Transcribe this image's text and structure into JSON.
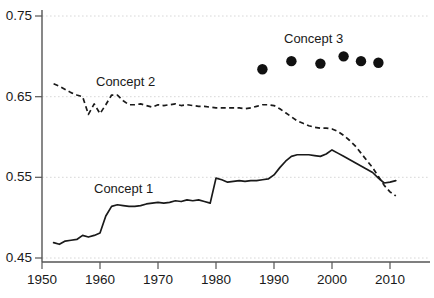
{
  "chart_data": {
    "type": "line",
    "title": "",
    "xlabel": "",
    "ylabel": "",
    "xlim": [
      1950,
      2012
    ],
    "ylim": [
      0.45,
      0.75
    ],
    "grid": true,
    "grid_axis": "y",
    "legend": "inline-annotations",
    "xticks": [
      1950,
      1960,
      1970,
      1980,
      1990,
      2000,
      2010
    ],
    "xtick_labels": [
      "1950",
      "1960",
      "1970",
      "1980",
      "1990",
      "2000",
      "2010"
    ],
    "yticks": [
      0.45,
      0.55,
      0.65,
      0.75
    ],
    "ytick_labels": [
      "0.45",
      "0.55",
      "0.65",
      "0.75"
    ],
    "annotations": [
      {
        "text": "Concept 1",
        "x": 1961.5,
        "y": 0.5325,
        "series": "Concept 1"
      },
      {
        "text": "Concept 2",
        "x": 1962.0,
        "y": 0.6725,
        "series": "Concept 2"
      },
      {
        "text": "Concept 3",
        "x": 1996.5,
        "y": 0.7175,
        "series": "Concept 3"
      }
    ],
    "series": [
      {
        "name": "Concept 1",
        "style": "solid",
        "color": "#1a1a1a",
        "x": [
          1952,
          1953,
          1954,
          1955,
          1956,
          1957,
          1958,
          1959,
          1960,
          1961,
          1962,
          1963,
          1964,
          1965,
          1966,
          1967,
          1968,
          1969,
          1970,
          1971,
          1972,
          1973,
          1974,
          1975,
          1976,
          1977,
          1978,
          1979,
          1980,
          1981,
          1982,
          1983,
          1984,
          1985,
          1986,
          1987,
          1988,
          1989,
          1990,
          1991,
          1992,
          1993,
          1994,
          1995,
          1996,
          1997,
          1998,
          1999,
          2000,
          2001,
          2002,
          2003,
          2004,
          2005,
          2006,
          2007,
          2008,
          2009,
          2010,
          2011
        ],
        "values": [
          0.469,
          0.467,
          0.471,
          0.472,
          0.473,
          0.478,
          0.476,
          0.478,
          0.481,
          0.502,
          0.514,
          0.516,
          0.515,
          0.514,
          0.514,
          0.515,
          0.517,
          0.518,
          0.519,
          0.518,
          0.519,
          0.521,
          0.52,
          0.522,
          0.521,
          0.522,
          0.52,
          0.518,
          0.549,
          0.547,
          0.544,
          0.545,
          0.546,
          0.545,
          0.546,
          0.546,
          0.547,
          0.548,
          0.553,
          0.562,
          0.57,
          0.576,
          0.578,
          0.578,
          0.578,
          0.577,
          0.576,
          0.579,
          0.584,
          0.58,
          0.576,
          0.572,
          0.568,
          0.564,
          0.56,
          0.556,
          0.549,
          0.543,
          0.544,
          0.546
        ]
      },
      {
        "name": "Concept 2",
        "style": "dashed",
        "color": "#1a1a1a",
        "x": [
          1952,
          1953,
          1954,
          1955,
          1956,
          1957,
          1958,
          1959,
          1960,
          1961,
          1962,
          1963,
          1964,
          1965,
          1966,
          1967,
          1968,
          1969,
          1970,
          1971,
          1972,
          1973,
          1974,
          1975,
          1976,
          1977,
          1978,
          1979,
          1980,
          1981,
          1982,
          1983,
          1984,
          1985,
          1986,
          1987,
          1988,
          1989,
          1990,
          1991,
          1992,
          1993,
          1994,
          1995,
          1996,
          1997,
          1998,
          1999,
          2000,
          2001,
          2002,
          2003,
          2004,
          2005,
          2006,
          2007,
          2008,
          2009,
          2010,
          2011
        ],
        "values": [
          0.666,
          0.663,
          0.659,
          0.655,
          0.652,
          0.65,
          0.628,
          0.641,
          0.629,
          0.64,
          0.652,
          0.652,
          0.645,
          0.64,
          0.64,
          0.641,
          0.639,
          0.637,
          0.64,
          0.639,
          0.64,
          0.641,
          0.639,
          0.64,
          0.639,
          0.638,
          0.638,
          0.637,
          0.636,
          0.636,
          0.636,
          0.636,
          0.636,
          0.635,
          0.636,
          0.638,
          0.64,
          0.64,
          0.639,
          0.635,
          0.63,
          0.625,
          0.62,
          0.617,
          0.614,
          0.612,
          0.611,
          0.611,
          0.61,
          0.607,
          0.602,
          0.596,
          0.589,
          0.58,
          0.571,
          0.562,
          0.551,
          0.54,
          0.532,
          0.527
        ]
      },
      {
        "name": "Concept 3",
        "style": "markers",
        "marker": "filled-circle",
        "color": "#111111",
        "x": [
          1988,
          1993,
          1998,
          2002,
          2005,
          2008
        ],
        "values": [
          0.684,
          0.694,
          0.691,
          0.7,
          0.694,
          0.692
        ]
      }
    ]
  },
  "axis": {
    "y_tick_labels": [
      {
        "text": "0.75"
      },
      {
        "text": "0.65"
      },
      {
        "text": "0.55"
      },
      {
        "text": "0.45"
      }
    ],
    "x_tick_labels": [
      {
        "text": "1950"
      },
      {
        "text": "1960"
      },
      {
        "text": "1970"
      },
      {
        "text": "1980"
      },
      {
        "text": "1990"
      },
      {
        "text": "2000"
      },
      {
        "text": "2010"
      }
    ]
  },
  "labels": {
    "concept1": "Concept 1",
    "concept2": "Concept 2",
    "concept3": "Concept 3"
  },
  "colors": {
    "line": "#1a1a1a",
    "grid": "#d8d8d8",
    "axis": "#555555",
    "marker": "#111111",
    "text": "#1a1a1a",
    "background": "#ffffff"
  }
}
